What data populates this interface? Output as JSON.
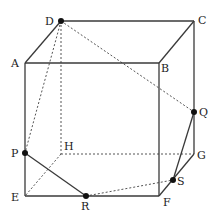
{
  "diagram": {
    "type": "cube-section",
    "vertices": {
      "A": {
        "x": 25,
        "y": 63
      },
      "B": {
        "x": 159,
        "y": 63
      },
      "C": {
        "x": 194,
        "y": 21
      },
      "D": {
        "x": 61,
        "y": 21
      },
      "E": {
        "x": 25,
        "y": 196
      },
      "F": {
        "x": 159,
        "y": 196
      },
      "G": {
        "x": 194,
        "y": 154
      },
      "H": {
        "x": 61,
        "y": 154
      },
      "P": {
        "x": 25,
        "y": 153
      },
      "Q": {
        "x": 194,
        "y": 112
      },
      "R": {
        "x": 86,
        "y": 196
      },
      "S": {
        "x": 173,
        "y": 180
      }
    },
    "marked_points": [
      "D",
      "P",
      "Q",
      "R",
      "S"
    ],
    "solid_edges": [
      [
        "A",
        "B"
      ],
      [
        "B",
        "C"
      ],
      [
        "C",
        "D"
      ],
      [
        "D",
        "A"
      ],
      [
        "A",
        "E"
      ],
      [
        "B",
        "F"
      ],
      [
        "C",
        "G"
      ],
      [
        "E",
        "F"
      ],
      [
        "F",
        "G"
      ],
      [
        "P",
        "R"
      ],
      [
        "Q",
        "S"
      ]
    ],
    "dashed_edges": [
      [
        "D",
        "H"
      ],
      [
        "H",
        "E"
      ],
      [
        "H",
        "G"
      ],
      [
        "D",
        "Q"
      ],
      [
        "D",
        "P"
      ],
      [
        "R",
        "S"
      ]
    ]
  },
  "labels": {
    "A": "A",
    "B": "B",
    "C": "C",
    "D": "D",
    "E": "E",
    "F": "F",
    "G": "G",
    "H": "H",
    "P": "P",
    "Q": "Q",
    "R": "R",
    "S": "S"
  }
}
